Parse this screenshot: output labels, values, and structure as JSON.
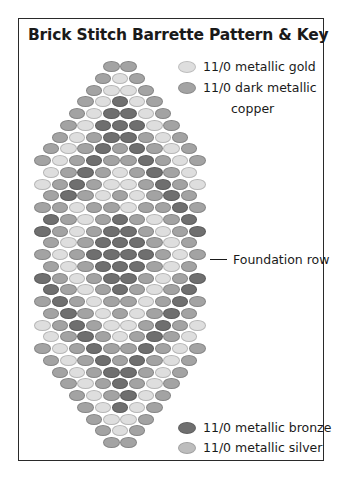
{
  "title": "Brick Stitch Barrette Pattern & Key",
  "colors": {
    "G": "#dedede",
    "C": "#a3a3a3",
    "B": "#6f6f6f",
    "S": "#bdbdbd"
  },
  "legend": {
    "top": [
      {
        "code": "G",
        "label": "11/0 metallic gold"
      },
      {
        "code": "C",
        "label": "11/0 dark metallic",
        "label2": "copper"
      }
    ],
    "bottom": [
      {
        "code": "B",
        "label": "11/0 metallic bronze"
      },
      {
        "code": "S",
        "label": "11/0 metallic silver"
      }
    ]
  },
  "annotation": {
    "foundation_label": "Foundation row"
  },
  "pattern": {
    "center_x": 120,
    "top_y": 61,
    "row_pitch": 11.75,
    "bead_pitch": 17.2,
    "rows": [
      "CC",
      "CGC",
      "CGGC",
      "CGBGC",
      "CGBBGC",
      "CGBBBGC",
      "CGCBBCGC",
      "CGCBCBCGC",
      "CGCBCCBCGC",
      "GCBCGCBCG",
      "GCBCGGCBCG",
      "CBCGCGCBC",
      "CCGCCGCCBC",
      "BCGCBCGCB",
      "BCGCBBCGCB",
      "CGCBBBCGC",
      "CGCBBBBCGC",
      "CGCBBBCGC",
      "BCGCBBCGCB",
      "BCGCBCGCB",
      "CBCGCCGCBC",
      "CBCGCGCBC",
      "GCBCGGCBCG",
      "GCBCGCBCG",
      "CGCBCCBCGC",
      "CGCBCBCGC",
      "CGCBBCGC",
      "CGCBCGC",
      "CGCBGC",
      "CGBGC",
      "CGGC",
      "CGC",
      "CC"
    ]
  }
}
